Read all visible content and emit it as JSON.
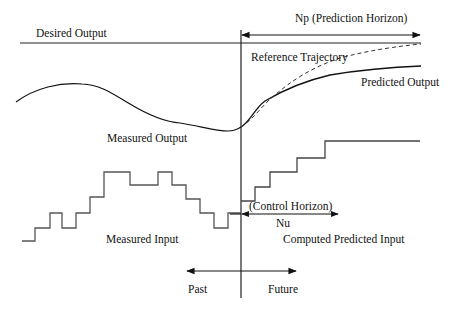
{
  "diagram": {
    "labels": {
      "desired_output": "Desired Output",
      "prediction_horizon": "Np (Prediction Horizon)",
      "reference_trajectory": "Reference Trajectory",
      "predicted_output": "Predicted Output",
      "measured_output": "Measured Output",
      "control_horizon": "(Control Horizon)",
      "nu": "Nu",
      "measured_input": "Measured Input",
      "computed_predicted_input": "Computed Predicted Input",
      "past": "Past",
      "future": "Future"
    },
    "colors": {
      "line": "#111111",
      "step_line": "#555555",
      "background": "#ffffff"
    }
  }
}
